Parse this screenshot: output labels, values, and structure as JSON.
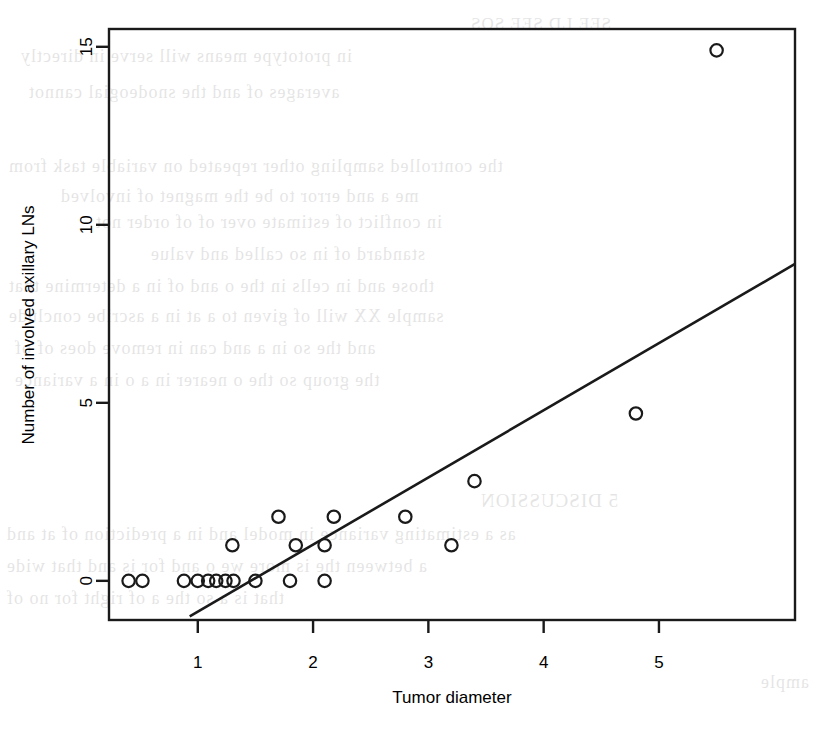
{
  "figure": {
    "background_color": "#ffffff",
    "ink_color": "#1a1a1a",
    "page_bleed_text": [
      {
        "text": "SEE LD SEE SOS",
        "x": 470,
        "y": 14,
        "size": 17
      },
      {
        "text": "in prototype means will serve in directly",
        "x": 20,
        "y": 46,
        "size": 18
      },
      {
        "text": "averages of and the snodeogial cannot",
        "x": 28,
        "y": 82,
        "size": 18
      },
      {
        "text": "the controlled sampling other repeated on variable task from",
        "x": 8,
        "y": 156,
        "size": 18
      },
      {
        "text": "me a and error to be the magnet of involved",
        "x": 60,
        "y": 186,
        "size": 18
      },
      {
        "text": "in conflict of estimate over of of order not",
        "x": 95,
        "y": 212,
        "size": 18
      },
      {
        "text": "standard of in so called and value",
        "x": 150,
        "y": 244,
        "size": 18
      },
      {
        "text": "those and in cells in the o and of in a determine that",
        "x": 8,
        "y": 276,
        "size": 18
      },
      {
        "text": "sample XX will of given to a at in a ascribe conclude",
        "x": 8,
        "y": 306,
        "size": 18
      },
      {
        "text": "and the so in a and can in remove does of of",
        "x": 14,
        "y": 338,
        "size": 18
      },
      {
        "text": "the group so the o nearer in a o in a variance",
        "x": 14,
        "y": 370,
        "size": 18
      },
      {
        "text": "5 DISCUSSION",
        "x": 480,
        "y": 490,
        "size": 19
      },
      {
        "text": "as a estimating variance in model and in a prediction of at and",
        "x": 6,
        "y": 524,
        "size": 18
      },
      {
        "text": "a between the is more we o and for is and that wide",
        "x": 6,
        "y": 556,
        "size": 18
      },
      {
        "text": "that is a so the a of right for no of",
        "x": 6,
        "y": 588,
        "size": 18
      },
      {
        "text": "ample",
        "x": 760,
        "y": 672,
        "size": 18
      }
    ],
    "plot_box": {
      "left": 109,
      "top": 29,
      "right": 795,
      "bottom": 620
    },
    "x_axis": {
      "label": "Tumor diameter",
      "ticks": [
        1,
        2,
        3,
        4,
        5
      ],
      "tick_labels": [
        "1",
        "2",
        "3",
        "4",
        "5"
      ],
      "range": [
        0.23,
        6.18
      ]
    },
    "y_axis": {
      "label": "Number of involved axillary LNs",
      "ticks": [
        0,
        5,
        10,
        15
      ],
      "tick_labels": [
        "0",
        "5",
        "10",
        "15"
      ],
      "range": [
        -1.1,
        15.5
      ]
    }
  },
  "chart_data": {
    "type": "scatter",
    "title": "",
    "xlabel": "Tumor diameter",
    "ylabel": "Number of involved axillary LNs",
    "xlim": [
      0.23,
      6.18
    ],
    "ylim": [
      -1.1,
      15.5
    ],
    "grid": false,
    "legend": false,
    "marker": "open-circle",
    "points": [
      {
        "x": 0.4,
        "y": 0
      },
      {
        "x": 0.52,
        "y": 0
      },
      {
        "x": 0.88,
        "y": 0
      },
      {
        "x": 1.0,
        "y": 0
      },
      {
        "x": 1.09,
        "y": 0
      },
      {
        "x": 1.16,
        "y": 0
      },
      {
        "x": 1.24,
        "y": 0
      },
      {
        "x": 1.31,
        "y": 0
      },
      {
        "x": 1.5,
        "y": 0
      },
      {
        "x": 1.8,
        "y": 0
      },
      {
        "x": 2.1,
        "y": 0
      },
      {
        "x": 1.3,
        "y": 1
      },
      {
        "x": 1.85,
        "y": 1
      },
      {
        "x": 2.1,
        "y": 1
      },
      {
        "x": 3.2,
        "y": 1
      },
      {
        "x": 1.7,
        "y": 1.8
      },
      {
        "x": 2.18,
        "y": 1.8
      },
      {
        "x": 2.8,
        "y": 1.8
      },
      {
        "x": 3.4,
        "y": 2.8
      },
      {
        "x": 4.8,
        "y": 4.7
      },
      {
        "x": 5.5,
        "y": 14.9
      }
    ],
    "fit_line": {
      "type": "linear-regression",
      "x_start": 0.93,
      "y_start": -1.0,
      "x_end": 6.18,
      "y_end": 8.9
    }
  }
}
